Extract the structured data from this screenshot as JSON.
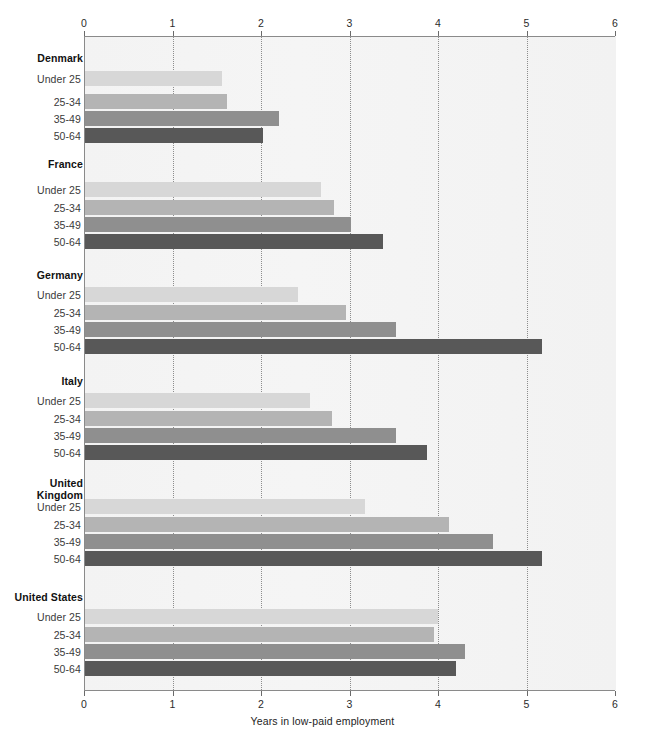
{
  "chart_data": {
    "type": "bar",
    "orientation": "horizontal",
    "title": "",
    "xlabel": "Years in low-paid employment",
    "ylabel": "",
    "xlim": [
      0,
      6
    ],
    "xticks": [
      "0",
      "1",
      "2",
      "3",
      "4",
      "5",
      "6"
    ],
    "grid": true,
    "grid_axis": "x",
    "axis_top_duplicated": true,
    "legend": "none",
    "categories": [
      "Under 25",
      "25-34",
      "35-49",
      "50-64"
    ],
    "category_colors": [
      "#d7d7d7",
      "#b4b4b4",
      "#8f8f8f",
      "#585858"
    ],
    "groups": [
      {
        "name": "Denmark",
        "values": [
          1.56,
          1.62,
          2.2,
          2.02
        ]
      },
      {
        "name": "France",
        "values": [
          2.68,
          2.83,
          3.02,
          3.38
        ]
      },
      {
        "name": "Germany",
        "values": [
          2.42,
          2.96,
          3.53,
          5.17
        ]
      },
      {
        "name": "Italy",
        "values": [
          2.55,
          2.8,
          3.52,
          3.88
        ]
      },
      {
        "name": "United Kingdom",
        "values": [
          3.18,
          4.12,
          4.62,
          5.17
        ]
      },
      {
        "name": "United States",
        "values": [
          4.0,
          3.96,
          4.3,
          4.2
        ]
      }
    ]
  },
  "axis": {
    "ticks": [
      {
        "label": "0",
        "value": 0
      },
      {
        "label": "1",
        "value": 1
      },
      {
        "label": "2",
        "value": 2
      },
      {
        "label": "3",
        "value": 3
      },
      {
        "label": "4",
        "value": 4
      },
      {
        "label": "5",
        "value": 5
      },
      {
        "label": "6",
        "value": 6
      }
    ],
    "title": "Years in low-paid employment"
  },
  "labels": {
    "denmark": "Denmark",
    "france": "France",
    "germany": "Germany",
    "italy": "Italy",
    "united_kingdom_line1": "United",
    "united_kingdom_line2": "Kingdom",
    "united_states": "United States",
    "under25": "Under 25",
    "age2534": "25-34",
    "age3549": "35-49",
    "age5064": "50-64"
  },
  "colors": {
    "plot_background": "#f4f4f4",
    "axis": "#8a8a8a",
    "gridline": "#8d8d8d",
    "bar_under25": "#d7d7d7",
    "bar_2534": "#b4b4b4",
    "bar_3549": "#8f8f8f",
    "bar_5064": "#585858"
  }
}
